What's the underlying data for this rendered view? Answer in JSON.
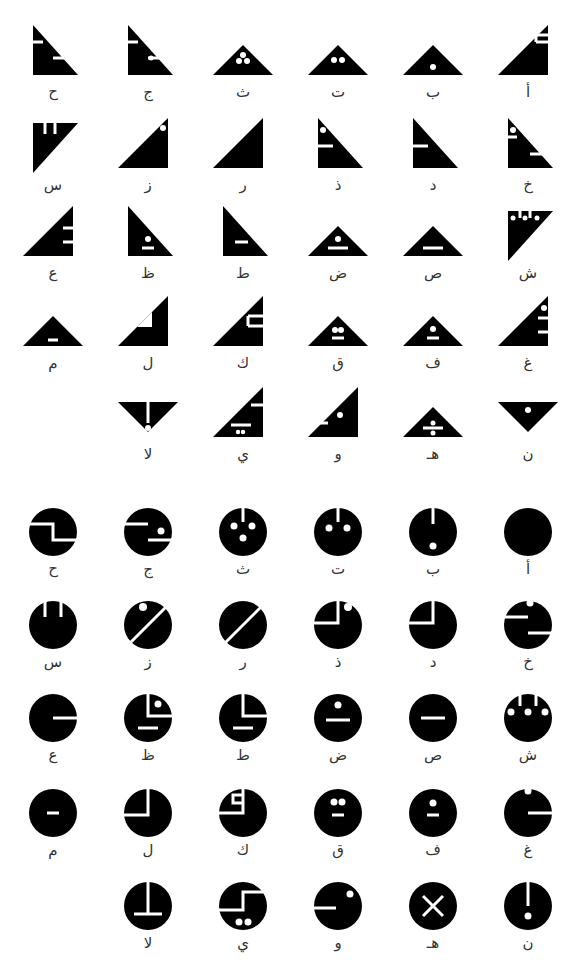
{
  "triangle_section": {
    "rows": [
      [
        {
          "letter": "أ",
          "glyph": "tri-right-up",
          "marks": "two-bars-top-right-notch"
        },
        {
          "letter": "ب",
          "glyph": "tri-up",
          "marks": "dot-bottom"
        },
        {
          "letter": "ت",
          "glyph": "tri-up",
          "marks": "two-dots"
        },
        {
          "letter": "ث",
          "glyph": "tri-up",
          "marks": "three-dots"
        },
        {
          "letter": "ج",
          "glyph": "tri-left-down",
          "marks": "bar-left-bar-mid-dot"
        },
        {
          "letter": "ح",
          "glyph": "tri-left-down",
          "marks": "bar-left-bar-mid"
        }
      ],
      [
        {
          "letter": "خ",
          "glyph": "tri-left-down",
          "marks": "dot-bar-left-bar-mid"
        },
        {
          "letter": "د",
          "glyph": "tri-left-down",
          "marks": "bar-left"
        },
        {
          "letter": "ذ",
          "glyph": "tri-left-down",
          "marks": "dot-bar-left"
        },
        {
          "letter": "ر",
          "glyph": "tri-right-up",
          "marks": "none"
        },
        {
          "letter": "ز",
          "glyph": "tri-right-up",
          "marks": "dot-top"
        },
        {
          "letter": "س",
          "glyph": "tri-inverted-left",
          "marks": "two-notches"
        }
      ],
      [
        {
          "letter": "ش",
          "glyph": "tri-inverted-left",
          "marks": "three-dots-notches"
        },
        {
          "letter": "ص",
          "glyph": "tri-up",
          "marks": "bar"
        },
        {
          "letter": "ض",
          "glyph": "tri-up",
          "marks": "dot-bar"
        },
        {
          "letter": "ط",
          "glyph": "tri-left-down",
          "marks": "short-bar"
        },
        {
          "letter": "ظ",
          "glyph": "tri-left-down",
          "marks": "dot-short-bar"
        },
        {
          "letter": "ع",
          "glyph": "tri-right-up",
          "marks": "two-bars-right"
        }
      ],
      [
        {
          "letter": "غ",
          "glyph": "tri-right-up",
          "marks": "dot-two-bars-right"
        },
        {
          "letter": "ف",
          "glyph": "tri-up",
          "marks": "dot-short-bar"
        },
        {
          "letter": "ق",
          "glyph": "tri-up",
          "marks": "two-dots-short-bar"
        },
        {
          "letter": "ك",
          "glyph": "tri-right-up",
          "marks": "corner-notch"
        },
        {
          "letter": "ل",
          "glyph": "tri-right-up",
          "marks": "inner-triangle"
        },
        {
          "letter": "م",
          "glyph": "tri-up",
          "marks": "small-bar"
        }
      ],
      [
        {
          "letter": "ن",
          "glyph": "tri-down",
          "marks": "dot"
        },
        {
          "letter": "هـ",
          "glyph": "tri-up",
          "marks": "dot-bar-dot"
        },
        {
          "letter": "و",
          "glyph": "tri-right-up",
          "marks": "bar-left-dot"
        },
        {
          "letter": "ي",
          "glyph": "tri-right-up",
          "marks": "bars-two-dots"
        },
        {
          "letter": "لا",
          "glyph": "tri-down",
          "marks": "vertical-bar-dot"
        }
      ]
    ]
  },
  "circle_section": {
    "rows": [
      [
        {
          "letter": "أ",
          "marks": "none"
        },
        {
          "letter": "ب",
          "marks": "top-slit-dot-bottom"
        },
        {
          "letter": "ت",
          "marks": "top-slit-two-dots"
        },
        {
          "letter": "ث",
          "marks": "top-slit-three-dots"
        },
        {
          "letter": "ج",
          "marks": "zigzag-dot"
        },
        {
          "letter": "ح",
          "marks": "zigzag"
        }
      ],
      [
        {
          "letter": "خ",
          "marks": "dot-zigzag"
        },
        {
          "letter": "د",
          "marks": "quadrant-left"
        },
        {
          "letter": "ذ",
          "marks": "quadrant-left-dot"
        },
        {
          "letter": "ر",
          "marks": "diagonal"
        },
        {
          "letter": "ز",
          "marks": "diagonal-dot"
        },
        {
          "letter": "س",
          "marks": "two-slits"
        }
      ],
      [
        {
          "letter": "ش",
          "marks": "two-slits-three-dots"
        },
        {
          "letter": "ص",
          "marks": "bar"
        },
        {
          "letter": "ض",
          "marks": "dot-bar"
        },
        {
          "letter": "ط",
          "marks": "quadrant-right-bar"
        },
        {
          "letter": "ظ",
          "marks": "quadrant-right-dot-bar"
        },
        {
          "letter": "ع",
          "marks": "right-slit"
        }
      ],
      [
        {
          "letter": "غ",
          "marks": "dot-right-slit"
        },
        {
          "letter": "ف",
          "marks": "dot-small-bar"
        },
        {
          "letter": "ق",
          "marks": "two-dots-small-bar"
        },
        {
          "letter": "ك",
          "marks": "quadrant-left-notch"
        },
        {
          "letter": "ل",
          "marks": "quadrant-left-wide"
        },
        {
          "letter": "م",
          "marks": "small-bar"
        }
      ],
      [
        {
          "letter": "ن",
          "marks": "top-slit-dot"
        },
        {
          "letter": "هـ",
          "marks": "cross"
        },
        {
          "letter": "و",
          "marks": "left-slit-dot"
        },
        {
          "letter": "ي",
          "marks": "s-shape-two-dots"
        },
        {
          "letter": "لا",
          "marks": "inverted-t"
        }
      ]
    ]
  }
}
